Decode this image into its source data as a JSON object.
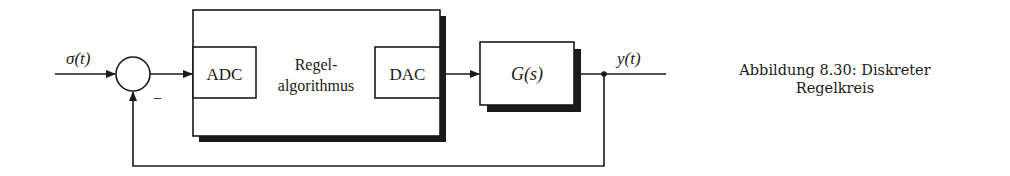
{
  "diagram": {
    "input_label": "σ(t)",
    "output_label": "y(t)",
    "summing_sign": "−",
    "controller_label_line1": "Regel-",
    "controller_label_line2": "algorithmus",
    "adc_label": "ADC",
    "dac_label": "DAC",
    "plant_label": "G(s)"
  },
  "caption": {
    "line1": "Abbildung 8.30: Diskreter",
    "line2": "Regelkreis"
  }
}
